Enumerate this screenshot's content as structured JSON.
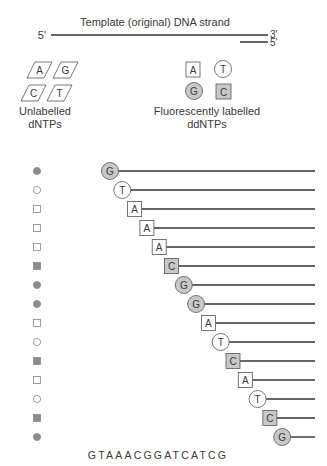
{
  "title": "Template (original) DNA strand",
  "template": {
    "left_end": "5'",
    "right_end": "3'"
  },
  "primer": {
    "right_end": "5'"
  },
  "unlabelled": {
    "bases": [
      "A",
      "G",
      "C",
      "T"
    ],
    "label_line1": "Unlabelled",
    "label_line2": "dNTPs"
  },
  "labelled": {
    "bases": [
      {
        "base": "A",
        "shape": "square",
        "fill": "white"
      },
      {
        "base": "T",
        "shape": "circle",
        "fill": "white"
      },
      {
        "base": "G",
        "shape": "circle",
        "fill": "grey"
      },
      {
        "base": "C",
        "shape": "square",
        "fill": "grey"
      }
    ],
    "label_line1": "Fluorescently labelled",
    "label_line2": "ddNTPs"
  },
  "shape_map": {
    "G": {
      "shape": "circle",
      "fill": "grey"
    },
    "T": {
      "shape": "circle",
      "fill": "white"
    },
    "A": {
      "shape": "square",
      "fill": "white"
    },
    "C": {
      "shape": "square",
      "fill": "grey"
    }
  },
  "colors": {
    "grey_fill": "#c8c8c8",
    "marker_grey": "#8c8c8c",
    "stroke": "#555555",
    "line": "#333333"
  },
  "fragments": [
    "G",
    "T",
    "A",
    "A",
    "A",
    "C",
    "G",
    "G",
    "A",
    "T",
    "C",
    "A",
    "T",
    "C",
    "G"
  ],
  "sequence": "GTAAACGGATCATCG"
}
